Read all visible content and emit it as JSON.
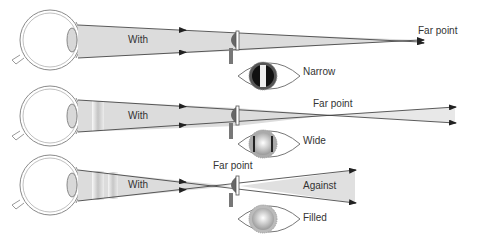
{
  "colors": {
    "beam": "#d9d9d9",
    "line": "#333333",
    "scope": "#666666",
    "eye_outline": "#8a8a8a"
  },
  "rows": [
    {
      "motion_label": "With",
      "far_point_label": "Far point",
      "reflex_label": "Narrow",
      "reflex_type": "narrow"
    },
    {
      "motion_label": "With",
      "far_point_label": "Far point",
      "reflex_label": "Wide",
      "reflex_type": "wide"
    },
    {
      "motion_label": "With",
      "far_point_label": "Far point",
      "after_label": "Against",
      "reflex_label": "Filled",
      "reflex_type": "filled"
    }
  ]
}
